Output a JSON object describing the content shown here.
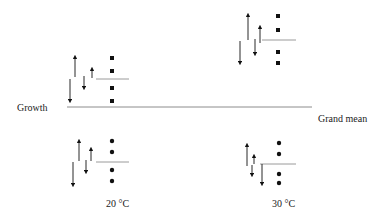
{
  "labels": {
    "response": "Growth",
    "grand_mean": "Grand mean",
    "group_20": "20 °C",
    "group_30": "30 °C"
  },
  "colors": {
    "ink": "#111111",
    "mean_line": "#9a9a9a",
    "grand_line": "#8c8c8c"
  },
  "grand_mean_line": {
    "x1": 67,
    "x2": 312,
    "y": 107
  },
  "groups": [
    {
      "id": "top-20C",
      "temperature": "20 °C",
      "marker": "square",
      "mean_line": {
        "x1": 96,
        "x2": 129,
        "y": 79
      },
      "points": [
        {
          "x": 112,
          "y": 58
        },
        {
          "x": 112,
          "y": 71
        },
        {
          "x": 112,
          "y": 88
        },
        {
          "x": 112,
          "y": 101
        }
      ],
      "arrows": [
        {
          "x": 75,
          "y1": 77,
          "y2": 57,
          "dir": "up"
        },
        {
          "x": 70,
          "y1": 79,
          "y2": 101,
          "dir": "down"
        },
        {
          "x": 84,
          "y1": 76,
          "y2": 88,
          "dir": "down"
        },
        {
          "x": 92,
          "y1": 78,
          "y2": 69,
          "dir": "up"
        }
      ]
    },
    {
      "id": "top-30C",
      "temperature": "30 °C",
      "marker": "square",
      "mean_line": {
        "x1": 262,
        "x2": 296,
        "y": 40
      },
      "points": [
        {
          "x": 278,
          "y": 16
        },
        {
          "x": 278,
          "y": 30
        },
        {
          "x": 278,
          "y": 52
        },
        {
          "x": 278,
          "y": 63
        }
      ],
      "arrows": [
        {
          "x": 248,
          "y1": 40,
          "y2": 15,
          "dir": "up"
        },
        {
          "x": 240,
          "y1": 41,
          "y2": 63,
          "dir": "down"
        },
        {
          "x": 255,
          "y1": 39,
          "y2": 54,
          "dir": "down"
        },
        {
          "x": 260,
          "y1": 43,
          "y2": 27,
          "dir": "up"
        }
      ]
    },
    {
      "id": "bottom-20C",
      "temperature": "20 °C",
      "marker": "circle",
      "mean_line": {
        "x1": 96,
        "x2": 129,
        "y": 162
      },
      "points": [
        {
          "x": 112,
          "y": 141
        },
        {
          "x": 112,
          "y": 152
        },
        {
          "x": 112,
          "y": 170
        },
        {
          "x": 112,
          "y": 181
        }
      ],
      "arrows": [
        {
          "x": 79,
          "y1": 161,
          "y2": 141,
          "dir": "up"
        },
        {
          "x": 73,
          "y1": 162,
          "y2": 185,
          "dir": "down"
        },
        {
          "x": 86,
          "y1": 160,
          "y2": 172,
          "dir": "down"
        },
        {
          "x": 91,
          "y1": 161,
          "y2": 149,
          "dir": "up"
        }
      ]
    },
    {
      "id": "bottom-30C",
      "temperature": "30 °C",
      "marker": "circle",
      "mean_line": {
        "x1": 260,
        "x2": 296,
        "y": 164
      },
      "points": [
        {
          "x": 279,
          "y": 143
        },
        {
          "x": 279,
          "y": 154
        },
        {
          "x": 279,
          "y": 174
        },
        {
          "x": 279,
          "y": 183
        }
      ],
      "arrows": [
        {
          "x": 247,
          "y1": 166,
          "y2": 145,
          "dir": "up"
        },
        {
          "x": 254,
          "y1": 164,
          "y2": 156,
          "dir": "up"
        },
        {
          "x": 252,
          "y1": 165,
          "y2": 175,
          "dir": "down"
        },
        {
          "x": 262,
          "y1": 164,
          "y2": 184,
          "dir": "down"
        }
      ]
    }
  ]
}
